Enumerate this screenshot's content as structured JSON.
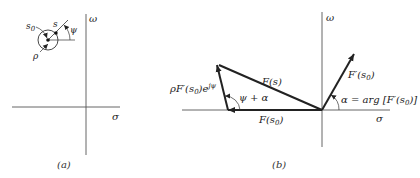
{
  "panel_a": {
    "caption": "(a)",
    "axis_labels": {
      "vertical": "ω",
      "horizontal": "σ"
    },
    "point_labels": {
      "s0": "s",
      "s0_sub": "0",
      "s": "s",
      "rho": "ρ",
      "psi": "ψ"
    }
  },
  "panel_b": {
    "caption": "(b)",
    "axis_labels": {
      "vertical": "ω",
      "horizontal": "σ"
    },
    "vector_labels": {
      "Fs": "F(s)",
      "Fs0_prefix": "F(s",
      "Fs0_sub": "0",
      "Fs0_suffix": ")",
      "rhoFprime_prefix": "ρF′(s",
      "rhoFprime_sub": "0",
      "rhoFprime_mid": ")e",
      "rhoFprime_sup": "jψ",
      "Fprime_prefix": "F′(s",
      "Fprime_sub": "0",
      "Fprime_suffix": ")"
    },
    "angle_labels": {
      "psi_alpha": "ψ + α",
      "alpha_eq_prefix": "α = arg [F′(s",
      "alpha_eq_sub": "0",
      "alpha_eq_suffix": ")]"
    }
  },
  "colors": {
    "line": "#222222",
    "axis": "#555555",
    "background": "#ffffff"
  }
}
